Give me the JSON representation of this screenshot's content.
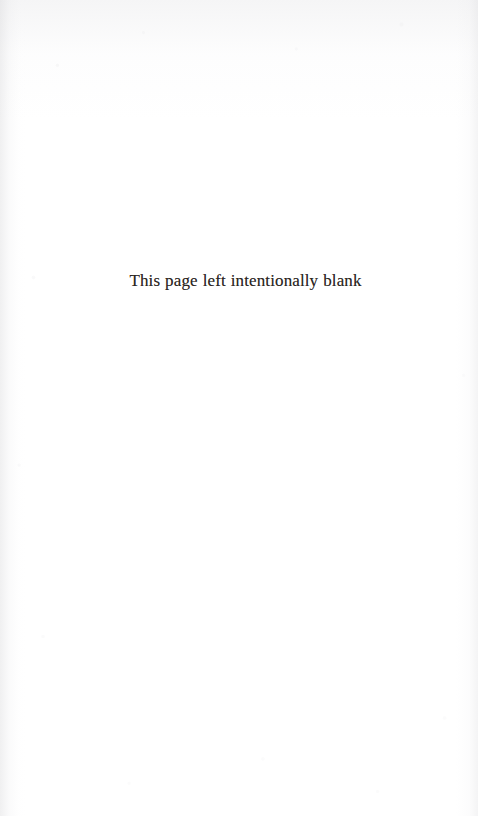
{
  "page": {
    "kind": "scanned-book-page",
    "background_color": "#ffffff",
    "ink_color": "#2b2622",
    "body_text": "This page left intentionally blank",
    "header": "",
    "footer": "",
    "page_number": ""
  }
}
